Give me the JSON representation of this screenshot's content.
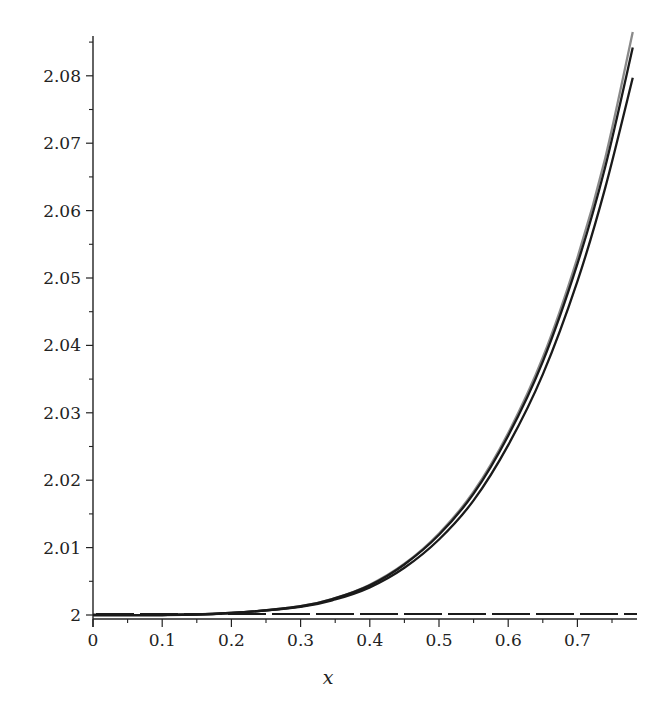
{
  "chart_data": {
    "type": "line",
    "title": "",
    "xlabel": "x",
    "ylabel": "",
    "xlim": [
      0,
      0.785
    ],
    "ylim": [
      1.9995,
      2.0865
    ],
    "grid": false,
    "legend": null,
    "x_ticks": [
      "0",
      "0.1",
      "0.2",
      "0.3",
      "0.4",
      "0.5",
      "0.6",
      "0.7"
    ],
    "y_ticks": [
      "2",
      "2.01",
      "2.02",
      "2.03",
      "2.04",
      "2.05",
      "2.06",
      "2.07",
      "2.08"
    ],
    "x": [
      0,
      0.1,
      0.2,
      0.3,
      0.35,
      0.4,
      0.45,
      0.5,
      0.55,
      0.6,
      0.65,
      0.7,
      0.74,
      0.78
    ],
    "series": [
      {
        "name": "curve-gray-upper",
        "color": "#8a8a8a",
        "style": "solid",
        "values": [
          2.0,
          2.0,
          2.0003,
          2.0013,
          2.0025,
          2.0045,
          2.0076,
          2.0121,
          2.0183,
          2.027,
          2.0382,
          2.053,
          2.0677,
          2.0865
        ]
      },
      {
        "name": "curve-black-middle",
        "color": "#1a1a1a",
        "style": "solid",
        "values": [
          2.0,
          2.0,
          2.0003,
          2.0013,
          2.0025,
          2.0044,
          2.0075,
          2.0119,
          2.018,
          2.0266,
          2.0376,
          2.0521,
          2.0664,
          2.0842
        ]
      },
      {
        "name": "curve-black-lower",
        "color": "#1a1a1a",
        "style": "solid",
        "values": [
          2.0,
          2.0,
          2.0003,
          2.0012,
          2.0023,
          2.0041,
          2.007,
          2.0112,
          2.017,
          2.0252,
          2.0357,
          2.0495,
          2.0633,
          2.0797
        ]
      },
      {
        "name": "dashed-baseline",
        "color": "#1a1a1a",
        "style": "dashed",
        "values": [
          2.0,
          2.0,
          2.0,
          2.0,
          2.0,
          2.0,
          2.0,
          2.0,
          2.0,
          2.0,
          2.0,
          2.0,
          2.0,
          2.0
        ]
      }
    ]
  }
}
